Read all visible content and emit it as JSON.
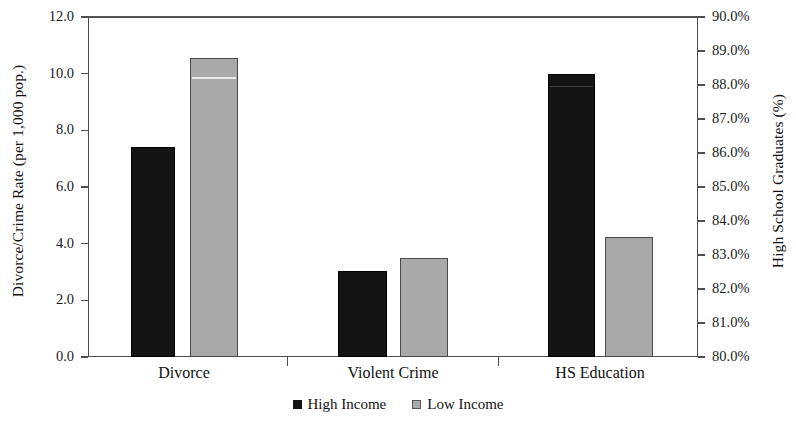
{
  "chart_data": {
    "type": "bar",
    "title": "",
    "subtitle": "",
    "categories": [
      "Divorce",
      "Violent Crime",
      "HS Education"
    ],
    "series": [
      {
        "name": "High Income",
        "color": "#141414",
        "values": [
          7.4,
          3.05,
          10.0
        ]
      },
      {
        "name": "Low Income",
        "color": "#a9a9a9",
        "values": [
          10.55,
          3.5,
          4.25
        ]
      }
    ],
    "secondary_axis_values": {
      "note": "HS Education bars are read on the right-hand axis",
      "series": [
        {
          "name": "High Income",
          "values": [
            null,
            null,
            88.3
          ]
        },
        {
          "name": "Low Income",
          "values": [
            null,
            null,
            83.5
          ]
        }
      ]
    },
    "xlabel": "",
    "ylabel": "Divorce/Crime Rate (per 1,000 pop.)",
    "y2label": "High School Graduates (%)",
    "ylim": [
      0.0,
      12.0
    ],
    "y2lim": [
      80.0,
      90.0
    ],
    "ytick_labels": [
      "12.0",
      "10.0",
      "8.0",
      "6.0",
      "4.0",
      "2.0",
      "0.0"
    ],
    "ytick_values": [
      12.0,
      10.0,
      8.0,
      6.0,
      4.0,
      2.0,
      0.0
    ],
    "y2tick_labels": [
      "90.0%",
      "89.0%",
      "88.0%",
      "87.0%",
      "86.0%",
      "85.0%",
      "84.0%",
      "83.0%",
      "82.0%",
      "81.0%",
      "80.0%"
    ],
    "y2tick_values": [
      90.0,
      89.0,
      88.0,
      87.0,
      86.0,
      85.0,
      84.0,
      83.0,
      82.0,
      81.0,
      80.0
    ],
    "grid": false,
    "legend_position": "bottom",
    "legend_entries": [
      "High Income",
      "Low Income"
    ]
  },
  "axes": {
    "left_title": "Divorce/Crime Rate (per 1,000 pop.)",
    "right_title": "High School Graduates (%)"
  },
  "legend": {
    "items": [
      {
        "label": "High Income",
        "swatch": "black-square-icon"
      },
      {
        "label": "Low Income",
        "swatch": "gray-square-icon"
      }
    ]
  },
  "y_ticks_left": [
    {
      "label": "12.0",
      "value": 12.0
    },
    {
      "label": "10.0",
      "value": 10.0
    },
    {
      "label": "8.0",
      "value": 8.0
    },
    {
      "label": "6.0",
      "value": 6.0
    },
    {
      "label": "4.0",
      "value": 4.0
    },
    {
      "label": "2.0",
      "value": 2.0
    },
    {
      "label": "0.0",
      "value": 0.0
    }
  ],
  "y_ticks_right": [
    {
      "label": "90.0%",
      "value": 90.0
    },
    {
      "label": "89.0%",
      "value": 89.0
    },
    {
      "label": "88.0%",
      "value": 88.0
    },
    {
      "label": "87.0%",
      "value": 87.0
    },
    {
      "label": "86.0%",
      "value": 86.0
    },
    {
      "label": "85.0%",
      "value": 85.0
    },
    {
      "label": "84.0%",
      "value": 84.0
    },
    {
      "label": "83.0%",
      "value": 83.0
    },
    {
      "label": "82.0%",
      "value": 82.0
    },
    {
      "label": "81.0%",
      "value": 81.0
    },
    {
      "label": "80.0%",
      "value": 80.0
    }
  ],
  "categories": [
    {
      "label": "Divorce"
    },
    {
      "label": "Violent Crime"
    },
    {
      "label": "HS Education"
    }
  ],
  "colors": {
    "high_income": "#141414",
    "low_income": "#a9a9a9",
    "axis": "#4d4d4d",
    "background": "#ffffff"
  }
}
